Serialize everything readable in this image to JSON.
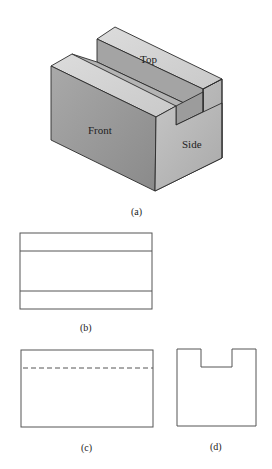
{
  "figure": {
    "panel_a": {
      "caption": "(a)",
      "faces": {
        "top": "Top",
        "front": "Front",
        "side": "Side"
      }
    },
    "panel_b": {
      "caption": "(b)",
      "view": "top view"
    },
    "panel_c": {
      "caption": "(c)",
      "view": "front view",
      "hidden_line": "dashed"
    },
    "panel_d": {
      "caption": "(d)",
      "view": "side view"
    }
  },
  "colors": {
    "front_face": "#9a9a9a",
    "side_face": "#b8b8b8",
    "top_face": "#d6d6d6",
    "slot_floor": "#a8a8a8",
    "line": "#555555"
  }
}
